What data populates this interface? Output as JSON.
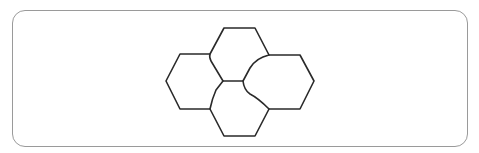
{
  "figure": {
    "type": "hexagon-cluster",
    "cells": [
      {
        "id": "top"
      },
      {
        "id": "left"
      },
      {
        "id": "right"
      },
      {
        "id": "bottom"
      }
    ],
    "stroke_color": "#2a2a2a",
    "frame_color": "#9a9a9a",
    "background_color": "#ffffff"
  }
}
